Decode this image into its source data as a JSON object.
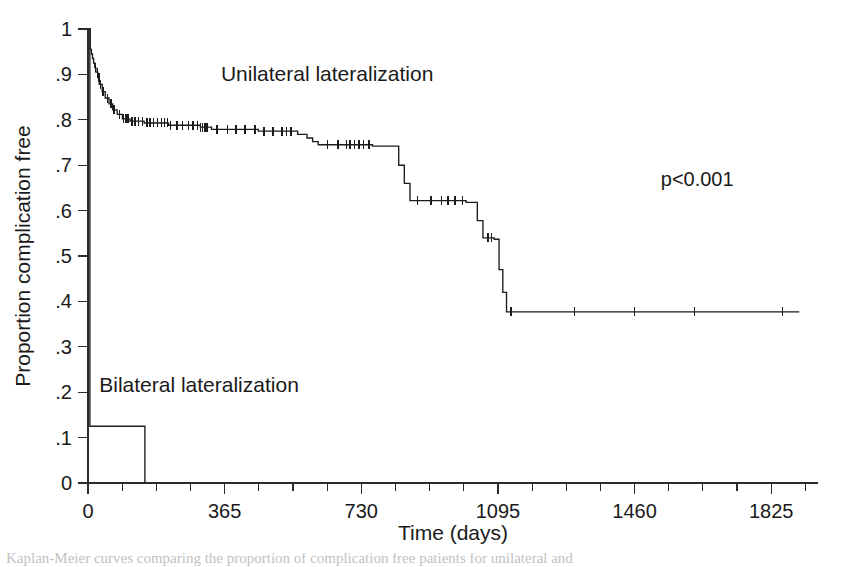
{
  "figure": {
    "background": "#ffffff",
    "ink_color": "#1c1c1c"
  },
  "caption": {
    "text": "Kaplan-Meier curves comparing the proportion of complication free patients for unilateral and"
  },
  "chart_data": {
    "type": "line",
    "subtype": "kaplan-meier-step",
    "title": "",
    "subtitle": "",
    "xlabel": "Time (days)",
    "ylabel": "Proportion complication free",
    "xlim": [
      0,
      1950
    ],
    "ylim": [
      0,
      1
    ],
    "grid": false,
    "legend_position": "inline-annotations",
    "x_ticks": [
      0,
      365,
      730,
      1095,
      1460,
      1825
    ],
    "x_tick_labels": [
      "0",
      "365",
      "730",
      "1095",
      "1460",
      "1825"
    ],
    "x_minor_tick_step": 91.25,
    "y_ticks": [
      0,
      0.1,
      0.2,
      0.3,
      0.4,
      0.5,
      0.6,
      0.7,
      0.8,
      0.9,
      1
    ],
    "y_tick_labels": [
      "0",
      ".1",
      ".2",
      ".3",
      ".4",
      ".5",
      ".6",
      ".7",
      ".8",
      ".9",
      "1"
    ],
    "annotations": [
      {
        "name": "p-value",
        "text": "p<0.001",
        "x": 1530,
        "y": 0.655
      },
      {
        "name": "unilateral-label",
        "text": "Unilateral lateralization",
        "x": 355,
        "y": 0.885
      },
      {
        "name": "bilateral-label",
        "text": "Bilateral lateralization",
        "x": 30,
        "y": 0.2
      }
    ],
    "series": [
      {
        "name": "Unilateral lateralization",
        "color": "#1c1c1c",
        "points": [
          [
            0,
            1.0
          ],
          [
            6,
            0.955
          ],
          [
            9,
            0.945
          ],
          [
            12,
            0.935
          ],
          [
            15,
            0.925
          ],
          [
            18,
            0.915
          ],
          [
            21,
            0.905
          ],
          [
            26,
            0.893
          ],
          [
            30,
            0.878
          ],
          [
            38,
            0.862
          ],
          [
            46,
            0.848
          ],
          [
            56,
            0.835
          ],
          [
            66,
            0.822
          ],
          [
            78,
            0.812
          ],
          [
            92,
            0.802
          ],
          [
            112,
            0.797
          ],
          [
            150,
            0.793
          ],
          [
            215,
            0.788
          ],
          [
            300,
            0.784
          ],
          [
            330,
            0.779
          ],
          [
            455,
            0.775
          ],
          [
            560,
            0.768
          ],
          [
            585,
            0.76
          ],
          [
            600,
            0.752
          ],
          [
            615,
            0.745
          ],
          [
            760,
            0.742
          ],
          [
            830,
            0.7
          ],
          [
            845,
            0.66
          ],
          [
            860,
            0.622
          ],
          [
            1010,
            0.618
          ],
          [
            1040,
            0.578
          ],
          [
            1055,
            0.54
          ],
          [
            1085,
            0.537
          ],
          [
            1098,
            0.47
          ],
          [
            1108,
            0.42
          ],
          [
            1118,
            0.377
          ],
          [
            1900,
            0.377
          ]
        ],
        "censor_times": [
          20,
          25,
          29,
          34,
          40,
          52,
          62,
          70,
          84,
          95,
          100,
          104,
          108,
          118,
          126,
          135,
          145,
          158,
          166,
          175,
          186,
          196,
          205,
          212,
          220,
          238,
          252,
          268,
          280,
          292,
          300,
          306,
          312,
          318,
          345,
          372,
          396,
          420,
          446,
          470,
          494,
          518,
          530,
          542,
          640,
          668,
          690,
          700,
          712,
          724,
          736,
          750,
          880,
          916,
          944,
          962,
          980,
          1000,
          1068,
          1078,
          1130,
          1300,
          1460,
          1620,
          1855
        ]
      },
      {
        "name": "Bilateral lateralization",
        "color": "#1c1c1c",
        "points": [
          [
            0,
            1.0
          ],
          [
            5,
            0.125
          ],
          [
            150,
            0.125
          ],
          [
            152,
            0.0
          ]
        ],
        "censor_times": []
      }
    ]
  }
}
